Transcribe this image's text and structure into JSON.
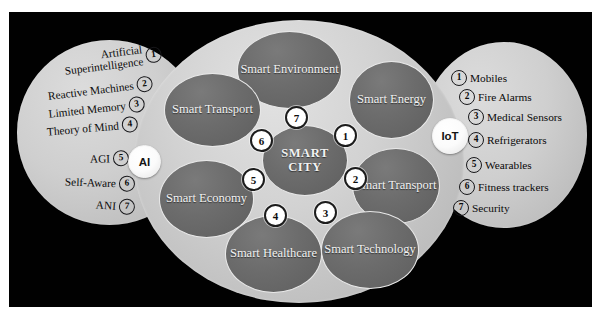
{
  "diagram": {
    "center_label": "SMART CITY",
    "ai_label": "AI",
    "iot_label": "IoT",
    "colors": {
      "background": "#010101",
      "lobe_fill": "#cfcfcf",
      "hub_fill": "#d2d2d2",
      "node_fill": "#6c6c6c",
      "node_text": "#f2f2f2",
      "bullet_fill": "#ffffff",
      "bullet_border": "#1c1c1c"
    }
  },
  "ai_list": [
    {
      "n": "1",
      "label": "Artificial Superintelligence"
    },
    {
      "n": "2",
      "label": "Reactive Machines"
    },
    {
      "n": "3",
      "label": "Limited Memory"
    },
    {
      "n": "4",
      "label": "Theory of Mind"
    },
    {
      "n": "5",
      "label": "AGI"
    },
    {
      "n": "6",
      "label": "Self-Aware"
    },
    {
      "n": "7",
      "label": "ANI"
    }
  ],
  "iot_list": [
    {
      "n": "1",
      "label": "Mobiles"
    },
    {
      "n": "2",
      "label": "Fire Alarms"
    },
    {
      "n": "3",
      "label": "Medical Sensors"
    },
    {
      "n": "4",
      "label": "Refrigerators"
    },
    {
      "n": "5",
      "label": "Wearables"
    },
    {
      "n": "6",
      "label": "Fitness trackers"
    },
    {
      "n": "7",
      "label": "Security"
    }
  ],
  "domains": [
    {
      "id": "smart-environment",
      "label": "Smart Environment"
    },
    {
      "id": "smart-energy",
      "label": "Smart Energy"
    },
    {
      "id": "smart-transport-left",
      "label": "Smart Transport"
    },
    {
      "id": "smart-transport-right",
      "label": "Smart Transport"
    },
    {
      "id": "smart-economy",
      "label": "Smart Economy"
    },
    {
      "id": "smart-healthcare",
      "label": "Smart Healthcare"
    },
    {
      "id": "smart-technology",
      "label": "Smart Technology"
    }
  ],
  "hub_bullets": [
    {
      "n": "1"
    },
    {
      "n": "2"
    },
    {
      "n": "3"
    },
    {
      "n": "4"
    },
    {
      "n": "5"
    },
    {
      "n": "6"
    },
    {
      "n": "7"
    }
  ]
}
